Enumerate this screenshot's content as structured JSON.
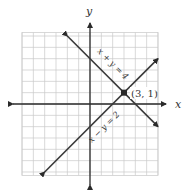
{
  "chart_data": {
    "type": "line",
    "title": "",
    "xlabel": "x",
    "ylabel": "y",
    "xlim": [
      -6,
      6
    ],
    "ylim": [
      -6.3,
      6.3
    ],
    "grid": true,
    "grid_step": 1,
    "series": [
      {
        "name": "x + y = 4",
        "label": "x + y = 4",
        "x": [
          -2,
          6
        ],
        "y": [
          6,
          -2
        ]
      },
      {
        "name": "x − y = 2",
        "label": "x − y = 2",
        "x": [
          -4,
          6
        ],
        "y": [
          -6,
          4
        ]
      }
    ],
    "annotations": [
      {
        "type": "point",
        "x": 3,
        "y": 1,
        "text": "(3, 1)"
      }
    ]
  },
  "labels": {
    "x_axis": "x",
    "y_axis": "y",
    "line1": "x + y = 4",
    "line2": "x − y = 2",
    "point": "(3, 1)"
  },
  "colors": {
    "grid": "#c8c8c8",
    "axis": "#2a2a2a",
    "line": "#3a3a3a"
  }
}
